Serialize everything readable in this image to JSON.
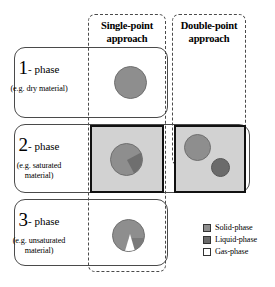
{
  "columns": [
    {
      "id": "single-point",
      "label": "Single-point\napproach",
      "line1": "Single-point",
      "line2": "approach"
    },
    {
      "id": "double-point",
      "label": "Double-point\napproach",
      "line1": "Double-point",
      "line2": "approach"
    }
  ],
  "rows": [
    {
      "id": "one-phase",
      "number": "1",
      "phase": "- phase",
      "example": "(e.g. dry material)"
    },
    {
      "id": "two-phase",
      "number": "2",
      "phase": "- phase",
      "example_line1": "(e.g. saturated",
      "example_line2": "material)"
    },
    {
      "id": "three-phase",
      "number": "3",
      "phase": "- phase",
      "example_line1": "(e.g. unsaturated",
      "example_line2": "material)"
    }
  ],
  "legend": {
    "items": [
      {
        "icon": "square-swatch-solid",
        "label": "Solid-phase",
        "color": "#8e8e8e"
      },
      {
        "icon": "square-swatch-liquid",
        "label": "Liquid-phase",
        "color": "#6b6b6b"
      },
      {
        "icon": "square-swatch-gas",
        "label": "Gas-phase",
        "color": "#ffffff"
      }
    ]
  },
  "colors": {
    "solid": "#8e8e8e",
    "liquid": "#6b6b6b",
    "gas": "#ffffff",
    "highlight_fill": "#d2d2d2",
    "highlight_border": "#111111",
    "outline": "#4a4a4a"
  },
  "chart_data": {
    "type": "diagram",
    "columns": [
      "Single-point approach",
      "Double-point approach"
    ],
    "rows": [
      "1 - phase",
      "2 - phase",
      "3 - phase"
    ],
    "cells": [
      {
        "row": "1 - phase",
        "column": "Single-point approach",
        "content": "one solid-phase circle",
        "circles": 1,
        "highlighted": false
      },
      {
        "row": "1 - phase",
        "column": "Double-point approach",
        "content": "empty",
        "circles": 0,
        "highlighted": false
      },
      {
        "row": "2 - phase",
        "column": "Single-point approach",
        "content": "one circle with solid and liquid phases combined",
        "circles": 1,
        "highlighted": true
      },
      {
        "row": "2 - phase",
        "column": "Double-point approach",
        "content": "two separate circles: solid-phase and liquid-phase",
        "circles": 2,
        "highlighted": true
      },
      {
        "row": "3 - phase",
        "column": "Single-point approach",
        "content": "one circle with solid, liquid and gas phases",
        "circles": 1,
        "highlighted": false
      },
      {
        "row": "3 - phase",
        "column": "Double-point approach",
        "content": "empty",
        "circles": 0,
        "highlighted": false
      }
    ],
    "legend": [
      "Solid-phase",
      "Liquid-phase",
      "Gas-phase"
    ]
  }
}
